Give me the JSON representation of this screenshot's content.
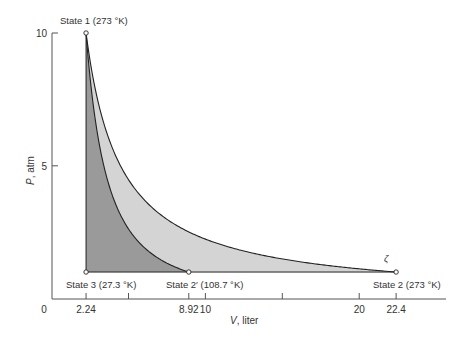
{
  "chart_data": {
    "type": "area",
    "title": "",
    "xlabel": "V, liter",
    "ylabel": "P, atm",
    "xlim": [
      0,
      25.5
    ],
    "ylim": [
      0,
      10
    ],
    "x_ticks": [
      {
        "value": 0,
        "label": "0"
      },
      {
        "value": 2.24,
        "label": "2.24"
      },
      {
        "value": 5,
        "label": ""
      },
      {
        "value": 8.92,
        "label": "8.92"
      },
      {
        "value": 10,
        "label": "10"
      },
      {
        "value": 15,
        "label": ""
      },
      {
        "value": 20,
        "label": "20"
      },
      {
        "value": 22.4,
        "label": "22.4"
      }
    ],
    "y_ticks": [
      {
        "value": 5,
        "label": "5"
      },
      {
        "value": 10,
        "label": "10"
      }
    ],
    "grid": false,
    "series": [
      {
        "name": "Isotherm (273 K)",
        "equation": "P = 22.4 / V",
        "x": [
          2.24,
          3,
          4,
          6,
          8,
          10,
          14,
          18,
          22.4
        ],
        "values": [
          10,
          7.47,
          5.6,
          3.73,
          2.8,
          2.24,
          1.6,
          1.24,
          1.0
        ]
      },
      {
        "name": "Adiabat",
        "equation": "P V^(5/3) = const",
        "x": [
          2.24,
          3,
          4,
          5,
          6,
          7,
          8,
          8.92
        ],
        "values": [
          10,
          6.14,
          3.8,
          2.62,
          1.94,
          1.5,
          1.2,
          1.0
        ]
      }
    ],
    "points": [
      {
        "label": "State 1 (273 °K)",
        "V": 2.24,
        "P": 10
      },
      {
        "label": "State 2 (273 °K)",
        "V": 22.4,
        "P": 1
      },
      {
        "label": "State 2′ (108.7 °K)",
        "V": 8.92,
        "P": 1
      },
      {
        "label": "State 3 (27.3 °K)",
        "V": 2.24,
        "P": 1
      }
    ],
    "annotations": [
      "ζ"
    ]
  },
  "labels": {
    "state1": "State 1 (273 °K)",
    "state2": "State 2 (273 °K)",
    "state2p": "State 2′ (108.7 °K)",
    "state3": "State 3 (27.3 °K)",
    "xlabel": "V, liter",
    "ylabel": "P, atm",
    "mark": "ζ"
  },
  "colors": {
    "light_fill": "#d4d4d4",
    "dark_fill": "#9a9a9a",
    "line": "#222222",
    "axis": "#555555"
  }
}
